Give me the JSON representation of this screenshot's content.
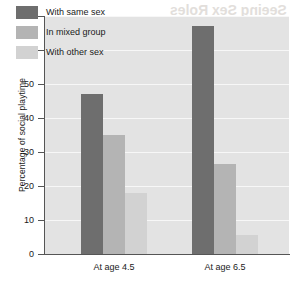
{
  "chart_data": {
    "type": "bar",
    "title": "",
    "xlabel": "",
    "ylabel": "Percentage of social playtime",
    "categories": [
      "At age 4.5",
      "At age 6.5"
    ],
    "series": [
      {
        "name": "With same sex",
        "color": "#6e6e6e",
        "values": [
          47,
          67
        ]
      },
      {
        "name": "In mixed group",
        "color": "#b4b4b4",
        "values": [
          35,
          26.5
        ]
      },
      {
        "name": "With other sex",
        "color": "#d2d2d2",
        "values": [
          18,
          5.5
        ]
      }
    ],
    "ylim": [
      0,
      70
    ],
    "yticks": [
      0,
      10,
      20,
      30,
      40,
      50,
      60,
      70
    ],
    "ytick_labels": [
      "0",
      "10",
      "20",
      "30",
      "40",
      "50",
      "60",
      "70"
    ],
    "grid": true,
    "grid_axis": "y",
    "legend_position": "upper-left-inside",
    "plot_background": "#e3e3e3",
    "gridline_color": "#f7f7f7",
    "axis_color": "#555555"
  },
  "ghost_text": {
    "top": "Seeing Sex Roles",
    "middle": "Making Connections"
  }
}
